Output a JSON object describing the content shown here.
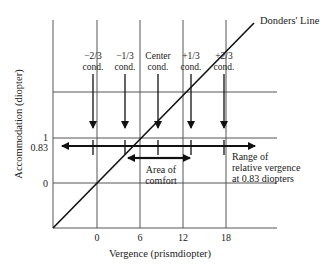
{
  "diagram": {
    "title_label": "Donders' Line",
    "y_axis_label": "Accommodation (diopter)",
    "x_axis_label": "Vergence (prismdiopter)",
    "x_ticks": [
      "0",
      "6",
      "12",
      "18"
    ],
    "y_ticks": [
      "1",
      "0.83",
      "0"
    ],
    "conditions": [
      {
        "line1": "−2/3",
        "line2": "cond."
      },
      {
        "line1": "−1/3",
        "line2": "cond."
      },
      {
        "line1": "Center",
        "line2": "cond."
      },
      {
        "line1": "+1/3",
        "line2": "cond."
      },
      {
        "line1": "+2/3",
        "line2": "cond."
      }
    ],
    "comfort_label": {
      "line1": "Area of",
      "line2": "comfort"
    },
    "range_label": {
      "line1": "Range of",
      "line2": "relative vergence",
      "line3": "at 0.83 diopters"
    },
    "colors": {
      "line": "#111111",
      "grid": "#555555",
      "text": "#222222"
    }
  }
}
